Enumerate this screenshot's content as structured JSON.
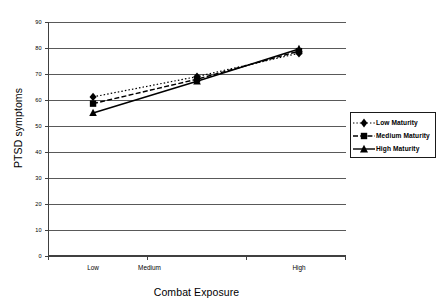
{
  "chart_data": {
    "type": "line",
    "title": "",
    "xlabel": "Combat Exposure",
    "ylabel": "PTSD symptoms",
    "categories": [
      "Low",
      "Medium",
      "High"
    ],
    "x": [
      0,
      1,
      2
    ],
    "xlim": [
      0,
      3
    ],
    "ylim": [
      0,
      90
    ],
    "yticks": [
      0,
      10,
      20,
      30,
      40,
      50,
      60,
      70,
      80,
      90
    ],
    "ytick_labels": [
      "0",
      "10",
      "20",
      "30",
      "40",
      "50",
      "60",
      "70",
      "80",
      "90"
    ],
    "xtick_labels": [
      "Low",
      "Medium",
      "High"
    ],
    "grid": "horizontal",
    "legend_position": "right",
    "series": [
      {
        "name": "Low Maturity",
        "marker": "diamond",
        "line_style": "dotted",
        "color": "#000000",
        "values": [
          61.2,
          69.0,
          78.0
        ]
      },
      {
        "name": "Medium Maturity",
        "marker": "square",
        "line_style": "dashed",
        "color": "#000000",
        "values": [
          58.6,
          68.0,
          78.8
        ]
      },
      {
        "name": "High Maturity",
        "marker": "triangle",
        "line_style": "solid",
        "color": "#000000",
        "values": [
          55.0,
          67.2,
          79.6
        ]
      }
    ]
  },
  "axis": {
    "y_title": "PTSD symptoms",
    "x_title": "Combat Exposure"
  },
  "legend": {
    "entries": [
      {
        "label": "Low  Maturity"
      },
      {
        "label": "Medium  Maturity"
      },
      {
        "label": "High  Maturity"
      }
    ]
  },
  "style": {
    "grid_color": "#595959",
    "axis_color": "#404040",
    "series_color": "#000000",
    "background": "#ffffff"
  }
}
